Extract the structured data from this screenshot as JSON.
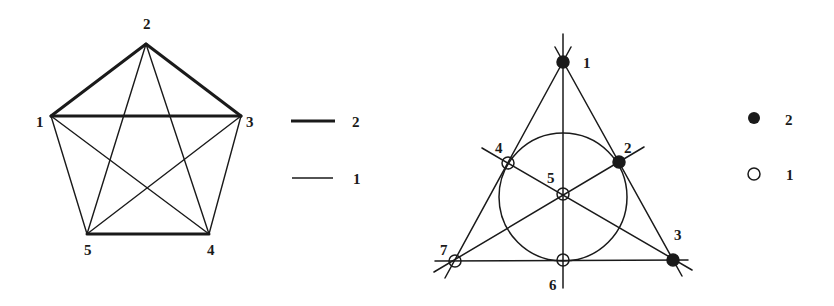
{
  "colors": {
    "ink": "#1a1a1a",
    "paper": "#ffffff"
  },
  "left_graph": {
    "vertices": [
      {
        "id": "1",
        "x": 51,
        "y": 116,
        "label_x": 36,
        "label_y": 127
      },
      {
        "id": "2",
        "x": 146,
        "y": 44,
        "label_x": 143,
        "label_y": 29
      },
      {
        "id": "3",
        "x": 241,
        "y": 116,
        "label_x": 246,
        "label_y": 127
      },
      {
        "id": "4",
        "x": 209,
        "y": 234,
        "label_x": 207,
        "label_y": 255
      },
      {
        "id": "5",
        "x": 87,
        "y": 234,
        "label_x": 84,
        "label_y": 255
      }
    ],
    "edges_weight_2": [
      [
        "1",
        "2"
      ],
      [
        "2",
        "3"
      ],
      [
        "1",
        "3"
      ],
      [
        "5",
        "4"
      ]
    ],
    "edges_weight_1": [
      [
        "1",
        "5"
      ],
      [
        "3",
        "4"
      ],
      [
        "1",
        "4"
      ],
      [
        "2",
        "5"
      ],
      [
        "2",
        "4"
      ],
      [
        "3",
        "5"
      ]
    ]
  },
  "left_legend": [
    {
      "label": "2",
      "style": "thick-line"
    },
    {
      "label": "1",
      "style": "thin-line"
    }
  ],
  "right_graph": {
    "points": [
      {
        "id": "1",
        "x": 563,
        "y": 62,
        "fill": "filled",
        "label_x": 583,
        "label_y": 63
      },
      {
        "id": "2",
        "x": 619,
        "y": 162,
        "fill": "filled",
        "label_x": 624,
        "label_y": 150
      },
      {
        "id": "3",
        "x": 673,
        "y": 260,
        "fill": "filled",
        "label_x": 674,
        "label_y": 238
      },
      {
        "id": "4",
        "x": 508,
        "y": 163,
        "fill": "open",
        "label_x": 495,
        "label_y": 150
      },
      {
        "id": "5",
        "x": 563,
        "y": 194,
        "fill": "open",
        "label_x": 548,
        "label_y": 180
      },
      {
        "id": "6",
        "x": 563,
        "y": 260,
        "fill": "open",
        "label_x": 549,
        "label_y": 291
      },
      {
        "id": "7",
        "x": 455,
        "y": 261,
        "fill": "open",
        "label_x": 440,
        "label_y": 253
      }
    ],
    "lines": [
      [
        "1",
        "2",
        "3"
      ],
      [
        "1",
        "4",
        "7"
      ],
      [
        "7",
        "6",
        "3"
      ],
      [
        "1",
        "5",
        "6"
      ],
      [
        "7",
        "5",
        "2"
      ],
      [
        "4",
        "5",
        "3"
      ]
    ],
    "circle": {
      "cx": 563,
      "cy": 197,
      "r": 64,
      "through": [
        "4",
        "2",
        "6"
      ]
    }
  },
  "right_legend": [
    {
      "label": "2",
      "style": "filled-dot"
    },
    {
      "label": "1",
      "style": "open-dot"
    }
  ]
}
